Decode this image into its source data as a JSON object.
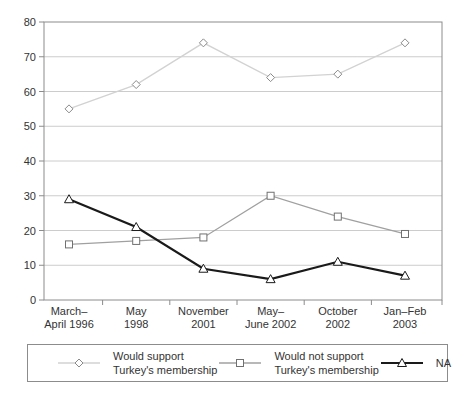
{
  "chart_data": {
    "type": "line",
    "categories": [
      "March–April 1996",
      "May 1998",
      "November 2001",
      "May–June 2002",
      "October 2002",
      "Jan–Feb 2003"
    ],
    "category_label_lines": [
      [
        "March–",
        "April 1996"
      ],
      [
        "May",
        "1998"
      ],
      [
        "November",
        "2001"
      ],
      [
        "May–",
        "June 2002"
      ],
      [
        "October",
        "2002"
      ],
      [
        "Jan–Feb",
        "2003"
      ]
    ],
    "series": [
      {
        "name": "Would support Turkey's membership",
        "values": [
          55,
          62,
          74,
          64,
          65,
          74
        ],
        "marker": "diamond",
        "line_color": "#d2d2d2",
        "marker_stroke": "#8a8a8a",
        "line_width": 1.3
      },
      {
        "name": "Would not support Turkey's membership",
        "values": [
          16,
          17,
          18,
          30,
          24,
          19
        ],
        "marker": "square",
        "line_color": "#a0a0a0",
        "marker_stroke": "#707070",
        "line_width": 1.3
      },
      {
        "name": "NA",
        "values": [
          29,
          21,
          9,
          6,
          11,
          7
        ],
        "marker": "triangle-up",
        "line_color": "#1a1a1a",
        "marker_stroke": "#1a1a1a",
        "line_width": 2.2
      }
    ],
    "title": "",
    "xlabel": "",
    "ylabel": "",
    "ylim": [
      0,
      80
    ],
    "ytick_step": 10,
    "ytick_labels": [
      "0",
      "10",
      "20",
      "30",
      "40",
      "50",
      "60",
      "70",
      "80"
    ],
    "grid": "horizontal",
    "grid_color": "#cccccc",
    "axis_color": "#8c8c8c",
    "legend_position": "bottom"
  },
  "legend": {
    "items": [
      {
        "label_line1": "Would support",
        "label_line2": "Turkey's membership"
      },
      {
        "label_line1": "Would not support",
        "label_line2": "Turkey's membership"
      },
      {
        "label_line1": "NA",
        "label_line2": ""
      }
    ]
  }
}
